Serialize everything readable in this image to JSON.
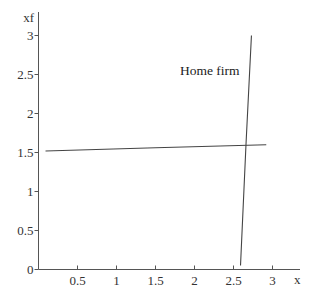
{
  "chart_data": {
    "type": "line",
    "title": "",
    "xlabel": "x",
    "ylabel": "xf",
    "xlim": [
      0,
      3.1
    ],
    "ylim": [
      0,
      3.1
    ],
    "grid": false,
    "legend": null,
    "x_ticks": [
      "0.5",
      "1",
      "1.5",
      "2",
      "2.5",
      "3"
    ],
    "x_tick_values": [
      0.5,
      1,
      1.5,
      2,
      2.5,
      3
    ],
    "y_ticks": [
      "0",
      "0.5",
      "1",
      "1.5",
      "2",
      "2.5",
      "3"
    ],
    "y_tick_values": [
      0,
      0.5,
      1,
      1.5,
      2,
      2.5,
      3
    ],
    "series": [
      {
        "name": "nearly horizontal curve",
        "points": [
          [
            0.09,
            1.52
          ],
          [
            1.5,
            1.56
          ],
          [
            2.92,
            1.6
          ]
        ]
      },
      {
        "name": "Home firm",
        "points": [
          [
            2.59,
            0.05
          ],
          [
            2.66,
            1.6
          ],
          [
            2.73,
            3.0
          ]
        ]
      }
    ],
    "annotations": [
      {
        "text": "Home firm",
        "x": 1.82,
        "y": 2.5
      }
    ]
  },
  "axes": {
    "x_label": "x",
    "y_label": "xf"
  },
  "annotation_text": "Home firm",
  "colors": {
    "axis": "#555555",
    "series": "#444444",
    "text": "#333333",
    "background": "#ffffff"
  }
}
